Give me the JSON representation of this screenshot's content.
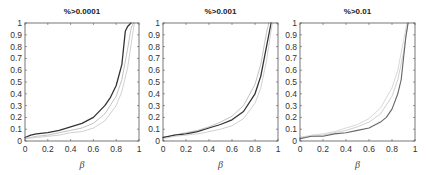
{
  "chart_data": [
    {
      "type": "line",
      "title": "%>0.0001",
      "xlabel": "β",
      "ylabel": "",
      "xlim": [
        0,
        1
      ],
      "ylim": [
        0,
        1
      ],
      "xticks": [
        0,
        0.2,
        0.4,
        0.6,
        0.8,
        1
      ],
      "yticks": [
        0,
        0.1,
        0.2,
        0.3,
        0.4,
        0.5,
        0.6,
        0.7,
        0.8,
        0.9,
        1
      ],
      "grid": false,
      "series": [
        {
          "name": "main",
          "color": "#333333",
          "width": 1.3,
          "x": [
            0,
            0.05,
            0.1,
            0.2,
            0.3,
            0.4,
            0.5,
            0.6,
            0.7,
            0.75,
            0.8,
            0.85,
            0.88,
            0.9,
            0.93
          ],
          "y": [
            0.03,
            0.05,
            0.06,
            0.07,
            0.09,
            0.12,
            0.15,
            0.2,
            0.3,
            0.37,
            0.47,
            0.65,
            0.93,
            0.97,
            1.0
          ]
        },
        {
          "name": "band-upper",
          "color": "#bbbbbb",
          "width": 0.9,
          "x": [
            0,
            0.1,
            0.2,
            0.3,
            0.4,
            0.5,
            0.6,
            0.7,
            0.8,
            0.85,
            0.9,
            0.93,
            0.95
          ],
          "y": [
            0.02,
            0.04,
            0.05,
            0.07,
            0.09,
            0.11,
            0.15,
            0.23,
            0.38,
            0.52,
            0.78,
            0.95,
            1.0
          ]
        },
        {
          "name": "band-lower",
          "color": "#cccccc",
          "width": 0.9,
          "x": [
            0,
            0.1,
            0.2,
            0.3,
            0.4,
            0.5,
            0.6,
            0.7,
            0.8,
            0.85,
            0.9,
            0.94,
            0.96
          ],
          "y": [
            0.02,
            0.03,
            0.04,
            0.05,
            0.07,
            0.08,
            0.11,
            0.17,
            0.3,
            0.42,
            0.62,
            0.88,
            1.0
          ]
        }
      ]
    },
    {
      "type": "line",
      "title": "%>0.001",
      "xlabel": "β",
      "ylabel": "",
      "xlim": [
        0,
        1
      ],
      "ylim": [
        0,
        1
      ],
      "xticks": [
        0,
        0.2,
        0.4,
        0.6,
        0.8,
        1
      ],
      "yticks": [
        0,
        0.1,
        0.2,
        0.3,
        0.4,
        0.5,
        0.6,
        0.7,
        0.8,
        0.9,
        1
      ],
      "grid": false,
      "series": [
        {
          "name": "band-upper",
          "color": "#bbbbbb",
          "width": 0.9,
          "x": [
            0,
            0.1,
            0.2,
            0.3,
            0.4,
            0.5,
            0.6,
            0.7,
            0.8,
            0.85,
            0.9,
            0.92
          ],
          "y": [
            0.03,
            0.05,
            0.07,
            0.09,
            0.12,
            0.16,
            0.21,
            0.3,
            0.48,
            0.65,
            0.92,
            1.0
          ]
        },
        {
          "name": "main",
          "color": "#333333",
          "width": 1.3,
          "x": [
            0,
            0.05,
            0.1,
            0.2,
            0.3,
            0.4,
            0.5,
            0.6,
            0.7,
            0.8,
            0.85,
            0.9,
            0.94
          ],
          "y": [
            0.03,
            0.04,
            0.05,
            0.06,
            0.08,
            0.11,
            0.14,
            0.18,
            0.25,
            0.4,
            0.55,
            0.8,
            1.0
          ]
        },
        {
          "name": "band-lower",
          "color": "#cccccc",
          "width": 0.9,
          "x": [
            0,
            0.1,
            0.2,
            0.3,
            0.4,
            0.5,
            0.6,
            0.7,
            0.8,
            0.85,
            0.9,
            0.95
          ],
          "y": [
            0.02,
            0.04,
            0.05,
            0.06,
            0.08,
            0.1,
            0.13,
            0.19,
            0.32,
            0.45,
            0.68,
            1.0
          ]
        }
      ]
    },
    {
      "type": "line",
      "title": "%>0.01",
      "xlabel": "β",
      "ylabel": "",
      "xlim": [
        0,
        1
      ],
      "ylim": [
        0,
        1
      ],
      "xticks": [
        0,
        0.2,
        0.4,
        0.6,
        0.8,
        1
      ],
      "yticks": [
        0,
        0.1,
        0.2,
        0.3,
        0.4,
        0.5,
        0.6,
        0.7,
        0.8,
        0.9,
        1
      ],
      "grid": false,
      "series": [
        {
          "name": "band-upper",
          "color": "#d4d4d4",
          "width": 0.9,
          "x": [
            0,
            0.1,
            0.2,
            0.3,
            0.4,
            0.5,
            0.6,
            0.7,
            0.8,
            0.85,
            0.9,
            0.93
          ],
          "y": [
            0.03,
            0.05,
            0.06,
            0.08,
            0.11,
            0.14,
            0.19,
            0.28,
            0.45,
            0.6,
            0.85,
            1.0
          ]
        },
        {
          "name": "band-lower",
          "color": "#cccccc",
          "width": 0.9,
          "x": [
            0,
            0.1,
            0.2,
            0.3,
            0.4,
            0.5,
            0.6,
            0.7,
            0.8,
            0.85,
            0.9,
            0.94
          ],
          "y": [
            0.03,
            0.04,
            0.05,
            0.07,
            0.09,
            0.12,
            0.16,
            0.23,
            0.38,
            0.52,
            0.75,
            1.0
          ]
        },
        {
          "name": "main",
          "color": "#666666",
          "width": 1.1,
          "x": [
            0,
            0.05,
            0.1,
            0.15,
            0.2,
            0.3,
            0.4,
            0.5,
            0.6,
            0.7,
            0.75,
            0.8,
            0.85,
            0.88,
            0.9,
            0.92,
            0.94
          ],
          "y": [
            0.02,
            0.03,
            0.04,
            0.04,
            0.04,
            0.06,
            0.07,
            0.09,
            0.11,
            0.16,
            0.2,
            0.27,
            0.4,
            0.52,
            0.7,
            0.88,
            1.0
          ]
        }
      ]
    }
  ],
  "panels": [
    {
      "title": "%>0.0001",
      "xlabel": "β"
    },
    {
      "title": "%>0.001",
      "xlabel": "β"
    },
    {
      "title": "%>0.01",
      "xlabel": "β"
    }
  ],
  "axis_color": "#555555"
}
